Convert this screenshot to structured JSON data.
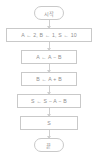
{
  "diagram": {
    "type": "flowchart",
    "orientation": "vertical",
    "title": "",
    "colors": {
      "background": "#ffffff",
      "node_border": "#c9c9c9",
      "node_fill": "#ffffff",
      "text": "#8f8f8f",
      "connector": "#cfcfcf"
    },
    "nodes": [
      {
        "id": "start",
        "shape": "terminal",
        "label": "시작"
      },
      {
        "id": "init",
        "shape": "process",
        "label": "A ← 2, B ← 1, S ← 10"
      },
      {
        "id": "step_a",
        "shape": "process",
        "label": "A ← A − B"
      },
      {
        "id": "step_b",
        "shape": "process",
        "label": "B ← A + B"
      },
      {
        "id": "step_s",
        "shape": "process",
        "label": "S ← S − A − B"
      },
      {
        "id": "output",
        "shape": "process",
        "label": "S"
      },
      {
        "id": "end",
        "shape": "terminal",
        "label": "끝"
      }
    ],
    "edges": [
      {
        "from": "start",
        "to": "init",
        "label": ""
      },
      {
        "from": "init",
        "to": "step_a",
        "label": ""
      },
      {
        "from": "step_a",
        "to": "step_b",
        "label": ""
      },
      {
        "from": "step_b",
        "to": "step_s",
        "label": ""
      },
      {
        "from": "step_s",
        "to": "output",
        "label": ""
      },
      {
        "from": "output",
        "to": "end",
        "label": ""
      }
    ]
  }
}
